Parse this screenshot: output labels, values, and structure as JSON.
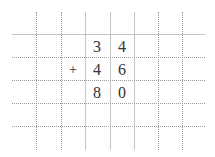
{
  "grid": {
    "vertical_lines": [
      {
        "x": 36,
        "style": "dotted"
      },
      {
        "x": 61,
        "style": "dotted"
      },
      {
        "x": 85,
        "style": "solid"
      },
      {
        "x": 110,
        "style": "solid"
      },
      {
        "x": 134,
        "style": "solid"
      },
      {
        "x": 158,
        "style": "dotted"
      },
      {
        "x": 182,
        "style": "dotted"
      }
    ],
    "horizontal_lines": [
      {
        "y": 34,
        "style": "solid"
      },
      {
        "y": 57,
        "style": "dotted"
      },
      {
        "y": 80,
        "style": "dotted"
      },
      {
        "y": 103,
        "style": "dotted"
      },
      {
        "y": 126,
        "style": "dotted"
      }
    ]
  },
  "problem": {
    "row1": {
      "tens": "3",
      "ones": "4"
    },
    "row2": {
      "operator": "+",
      "tens": "4",
      "ones": "6"
    },
    "result": {
      "tens": "8",
      "ones": "0"
    }
  }
}
